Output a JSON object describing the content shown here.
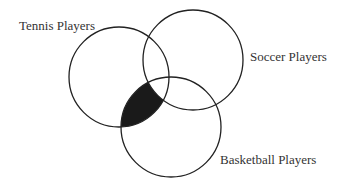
{
  "diagram": {
    "type": "venn",
    "sets": [
      {
        "id": "tennis",
        "label": "Tennis Players",
        "cx": 119,
        "cy": 77,
        "r": 50
      },
      {
        "id": "soccer",
        "label": "Soccer Players",
        "cx": 193,
        "cy": 60,
        "r": 50
      },
      {
        "id": "basketball",
        "label": "Basketball Players",
        "cx": 171,
        "cy": 127,
        "r": 50
      }
    ],
    "shaded_region": {
      "description": "Tennis ∩ Basketball, not Soccer",
      "in": [
        "tennis",
        "basketball"
      ],
      "not_in": [
        "soccer"
      ],
      "fill": "#1a1a1a"
    },
    "stroke_color": "#222222",
    "text_color": "#333333"
  },
  "labels": {
    "tennis": "Tennis Players",
    "soccer": "Soccer Players",
    "basketball": "Basketball Players"
  }
}
